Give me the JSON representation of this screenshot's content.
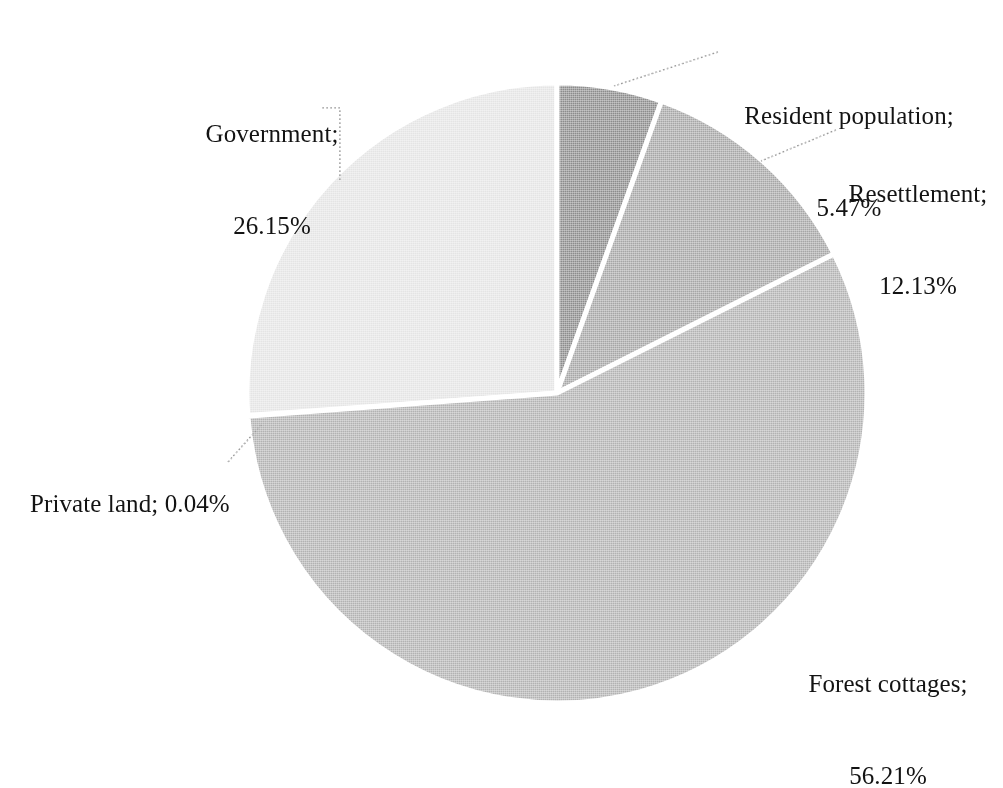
{
  "chart_data": {
    "type": "pie",
    "title": "",
    "subtitle": "",
    "xlabel": "",
    "ylabel": "",
    "legend_position": "none",
    "grid": false,
    "label_format": "{name}; {percent}%",
    "units": "percent",
    "start_angle_deg": 0,
    "direction": "clockwise",
    "categories": [
      "Resident population",
      "Resettlement",
      "Forest cottages",
      "Private land",
      "Government"
    ],
    "values": [
      5.47,
      12.13,
      56.21,
      0.04,
      26.15
    ],
    "slices": [
      {
        "name": "Resident population",
        "percent": 5.47,
        "percent_text": "5.47%",
        "label_line1": "Resident population;",
        "label_line2": "5.47%",
        "color": "#8c8c8c",
        "start_deg": 0.0,
        "end_deg": 19.692
      },
      {
        "name": "Resettlement",
        "percent": 12.13,
        "percent_text": "12.13%",
        "label_line1": "Resettlement;",
        "label_line2": "12.13%",
        "color": "#a6a6a6",
        "start_deg": 19.692,
        "end_deg": 63.36
      },
      {
        "name": "Forest cottages",
        "percent": 56.21,
        "percent_text": "56.21%",
        "label_line1": "Forest cottages;",
        "label_line2": "56.21%",
        "color": "#b2b2b2",
        "start_deg": 63.36,
        "end_deg": 265.716
      },
      {
        "name": "Private land",
        "percent": 0.04,
        "percent_text": "0.04%",
        "label_line1": "Private land; 0.04%",
        "label_line2": "",
        "color": "#bdbdbd",
        "start_deg": 265.716,
        "end_deg": 265.86
      },
      {
        "name": "Government",
        "percent": 26.15,
        "percent_text": "26.15%",
        "label_line1": "Government;",
        "label_line2": "26.15%",
        "color": "#e4e4e4",
        "start_deg": 265.86,
        "end_deg": 360.0
      }
    ],
    "total_percent": 100.0,
    "slice_border_color": "#ffffff",
    "background_color": "#ffffff",
    "text_color": "#131313",
    "leader_line_color": "#9a9a9a"
  }
}
